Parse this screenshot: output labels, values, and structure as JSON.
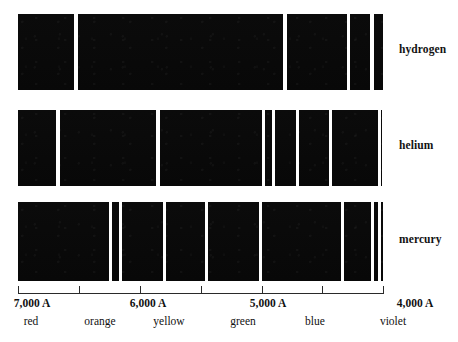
{
  "chart_data": {
    "type": "bar",
    "title": "",
    "subtitle": "",
    "xlabel": "",
    "ylabel": "",
    "axis": {
      "orientation": "horizontal",
      "reversed": true,
      "xlim": [
        7000,
        4000
      ],
      "unit": "A",
      "grid": false,
      "legend_position": "right",
      "tick_values": [
        7000,
        6500,
        6000,
        5500,
        5000,
        4500,
        4000
      ],
      "tick_labels": [
        "7,000 A",
        "",
        "6,000 A",
        "",
        "5,000 A",
        "",
        "4,000 A"
      ],
      "tick_labels_shown": [
        "7,000 A",
        "6,000 A",
        "5,000 A",
        "4,000 A"
      ],
      "color_bands": [
        {
          "name": "red",
          "center": 6850
        },
        {
          "name": "orange",
          "center": 6350
        },
        {
          "name": "yellow",
          "center": 5850
        },
        {
          "name": "green",
          "center": 5350
        },
        {
          "name": "blue",
          "center": 4750
        },
        {
          "name": "violet",
          "center": 4100
        }
      ]
    },
    "series": [
      {
        "name": "hydrogen",
        "label": "hydrogen",
        "lines_angstrom": [
          6560,
          4860,
          4340,
          4100
        ],
        "line_widths_angstrom": [
          30,
          25,
          22,
          30
        ]
      },
      {
        "name": "helium",
        "label": "helium",
        "lines_angstrom": [
          6690,
          5880,
          5020,
          4930,
          4720,
          4440,
          4030
        ],
        "line_widths_angstrom": [
          28,
          25,
          22,
          22,
          24,
          24,
          28
        ]
      },
      {
        "name": "mercury",
        "label": "mercury",
        "lines_angstrom": [
          6270,
          6190,
          5780,
          5460,
          5020,
          4360,
          4100,
          4050
        ],
        "line_widths_angstrom": [
          24,
          24,
          28,
          26,
          26,
          28,
          22,
          22
        ]
      }
    ]
  },
  "rows": [
    {
      "label": "hydrogen",
      "band": {
        "x": 18,
        "width": 365
      },
      "lines": [
        {
          "x": 74,
          "width": 4
        },
        {
          "x": 283,
          "width": 4
        },
        {
          "x": 347,
          "width": 3
        },
        {
          "x": 370,
          "width": 4
        }
      ]
    },
    {
      "label": "helium",
      "band": {
        "x": 18,
        "width": 364
      },
      "lines": [
        {
          "x": 56,
          "width": 4
        },
        {
          "x": 156,
          "width": 4
        },
        {
          "x": 262,
          "width": 3
        },
        {
          "x": 272,
          "width": 3
        },
        {
          "x": 296,
          "width": 3
        },
        {
          "x": 329,
          "width": 3
        },
        {
          "x": 378,
          "width": 3
        }
      ]
    },
    {
      "label": "mercury",
      "band": {
        "x": 18,
        "width": 365
      },
      "lines": [
        {
          "x": 109,
          "width": 3
        },
        {
          "x": 119,
          "width": 3
        },
        {
          "x": 163,
          "width": 3
        },
        {
          "x": 205,
          "width": 3
        },
        {
          "x": 259,
          "width": 3
        },
        {
          "x": 341,
          "width": 3
        },
        {
          "x": 371,
          "width": 3
        },
        {
          "x": 378,
          "width": 3
        }
      ]
    }
  ],
  "axis": {
    "line": {
      "x": 18,
      "width": 365,
      "y": 293
    },
    "ticks": [
      {
        "x": 18
      },
      {
        "x": 79
      },
      {
        "x": 140
      },
      {
        "x": 201
      },
      {
        "x": 262
      },
      {
        "x": 322
      },
      {
        "x": 383
      }
    ],
    "wavelength_labels": [
      {
        "text": "7,000 A",
        "x": 32
      },
      {
        "text": "6,000 A",
        "x": 148
      },
      {
        "text": "5,000 A",
        "x": 268
      },
      {
        "text": "4,000 A",
        "x": 415
      }
    ],
    "color_labels": [
      {
        "text": "red",
        "x": 31
      },
      {
        "text": "orange",
        "x": 100
      },
      {
        "text": "yellow",
        "x": 169
      },
      {
        "text": "green",
        "x": 243
      },
      {
        "text": "blue",
        "x": 315
      },
      {
        "text": "violet",
        "x": 393
      }
    ]
  },
  "colors": {
    "band": "#0a0a0a",
    "emission_line": "#ffffff",
    "background": "#ffffff",
    "axis": "#2a2a2a",
    "text": "#111111"
  }
}
